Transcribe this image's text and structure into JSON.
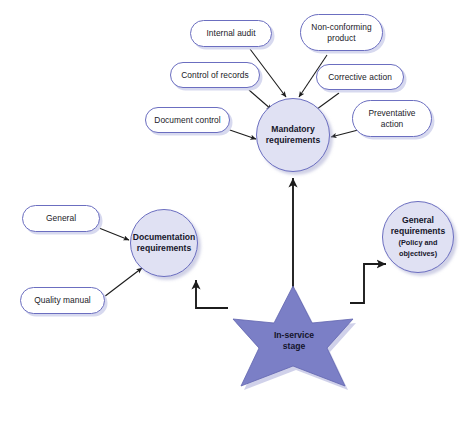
{
  "diagram": {
    "background_color": "#ffffff",
    "colors": {
      "node_border": "#6b6ec0",
      "pill_fill": "#ffffff",
      "circle_fill": "#e0e1f3",
      "star_fill": "#7b7fc6",
      "star_shade": "#6165ae",
      "text": "#16162a",
      "arrow": "#1c1c1c"
    },
    "central_node": {
      "shape": "six-pointed-star",
      "label_line1": "In-service",
      "label_line2": "stage"
    },
    "hub_nodes": [
      {
        "id": "mandatory",
        "shape": "circle",
        "label_line1": "Mandatory",
        "label_line2": "requirements",
        "sublabel": ""
      },
      {
        "id": "documentation",
        "shape": "circle",
        "label_line1": "Documentation",
        "label_line2": "requirements",
        "sublabel": ""
      },
      {
        "id": "general_requirements",
        "shape": "circle",
        "label_line1": "General",
        "label_line2": "requirements",
        "sublabel_line1": "(Policy and",
        "sublabel_line2": "objectives)"
      }
    ],
    "mandatory_inputs": [
      {
        "id": "internal_audit",
        "label_line1": "Internal audit",
        "label_line2": ""
      },
      {
        "id": "non_conforming",
        "label_line1": "Non-conforming",
        "label_line2": "product"
      },
      {
        "id": "control_of_records",
        "label_line1": "Control of records",
        "label_line2": ""
      },
      {
        "id": "corrective_action",
        "label_line1": "Corrective action",
        "label_line2": ""
      },
      {
        "id": "document_control",
        "label_line1": "Document control",
        "label_line2": ""
      },
      {
        "id": "preventative_action",
        "label_line1": "Preventative",
        "label_line2": "action"
      }
    ],
    "documentation_inputs": [
      {
        "id": "general",
        "label_line1": "General",
        "label_line2": ""
      },
      {
        "id": "quality_manual",
        "label_line1": "Quality manual",
        "label_line2": ""
      }
    ]
  }
}
